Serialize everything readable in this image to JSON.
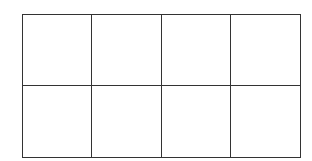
{
  "diagram": {
    "type": "grid",
    "rows": 2,
    "columns": 4,
    "line_color": "#333333",
    "background_color": "#ffffff",
    "cells": [
      {
        "row": 0,
        "col": 0,
        "label": ""
      },
      {
        "row": 0,
        "col": 1,
        "label": ""
      },
      {
        "row": 0,
        "col": 2,
        "label": ""
      },
      {
        "row": 0,
        "col": 3,
        "label": ""
      },
      {
        "row": 1,
        "col": 0,
        "label": ""
      },
      {
        "row": 1,
        "col": 1,
        "label": ""
      },
      {
        "row": 1,
        "col": 2,
        "label": ""
      },
      {
        "row": 1,
        "col": 3,
        "label": ""
      }
    ]
  }
}
